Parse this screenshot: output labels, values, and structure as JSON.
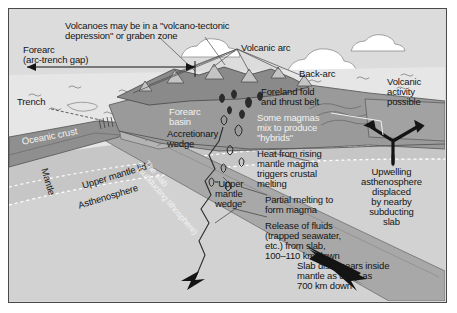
{
  "figure": {
    "type": "geological-block-diagram"
  },
  "colors": {
    "sky": "#dcdcdc",
    "ocean": "#e6e6e6",
    "cloud": "#ffffff",
    "continental_crust": "#9a9a9a",
    "volcanic_highland": "#8a8a8a",
    "oceanic_crust": "#8f8f8f",
    "slab": "#a8a8a8",
    "upper_mantle_lid": "#c6c6c6",
    "asthenosphere": "#d2d2d2",
    "mantle_deep": "#d8d8d8",
    "forearc_basin_fill": "#cfcfcf",
    "arrow": "#1a1a1a",
    "frame_border": "#4a4a4a",
    "text_dark": "#141414",
    "text_light": "#f2f2f2"
  },
  "labels": {
    "headline": "Volcanoes may be in a \"volcano-tectonic\ndepression\" or graben zone",
    "forearc_gap": "Forearc\n(arc-trench gap)",
    "volcanic_arc": "Volcanic arc",
    "back_arc": "Back-arc",
    "foreland_fold": "Foreland fold\nand thrust belt",
    "volcanic_activity": "Volcanic\nactivity\npossible",
    "trench": "Trench",
    "oceanic_crust": "Oceanic crust",
    "forearc_basin": "Forearc\nbasin",
    "accretionary_wedge": "Accretionary\nwedge",
    "some_magmas": "Some magmas\nmix to produce\n\"hybrids\"",
    "heat_from_rising": "Heat from rising\nmantle magma\ntriggers crustal\nmelting",
    "mantle": "Mantle",
    "upper_mantle_lid": "Upper mantle lid",
    "asthenosphere": "Asthenosphere",
    "the_slab": "The slab\n(subducting lithosphere)",
    "upper_mantle_wedge": "\"Upper\nmantle\nwedge\"",
    "partial_melting": "Partial melting to\nform magma",
    "release_of_fluids": "Release of fluids\n(trapped seawater,\netc.) from slab,\n100–110 km down",
    "slab_disappears": "Slab disappears inside\nmantle as deep as\n700 km down",
    "upwelling": "Upwelling\nasthenosphere\ndisplaced\nby nearby\nsubducting\nslab"
  },
  "icons": {
    "double_arrow_horizontal": "forearc-span-arrow",
    "y_arrow": "upwelling-asthenosphere-arrow",
    "slab_arrow": "slab-direction-arrow",
    "fluid_arrow": "fluid-release-arrow"
  }
}
